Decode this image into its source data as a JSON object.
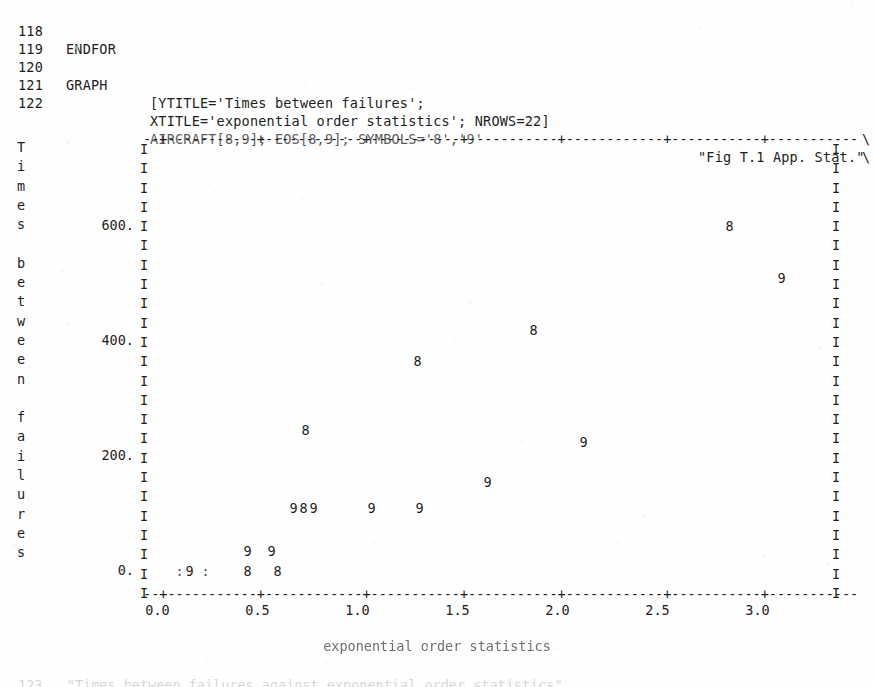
{
  "code_listing": {
    "lines": [
      {
        "num": "118",
        "keyword": "ENDFOR",
        "body": "",
        "tail": "",
        "cont": ""
      },
      {
        "num": "119",
        "keyword": "",
        "body": "",
        "tail": "",
        "cont": ""
      },
      {
        "num": "120",
        "keyword": "GRAPH",
        "body": "[YTITLE='Times between failures';",
        "tail": "",
        "cont": "\\"
      },
      {
        "num": "121",
        "keyword": "",
        "body": "XTITLE='exponential order statistics'; NROWS=22]",
        "tail": "",
        "cont": "\\"
      },
      {
        "num": "122",
        "keyword": "",
        "body": "AIRCRAFT[8,9]; EOS[8,9]; SYMBOLS='8','9'",
        "tail": "\"Fig T.1 App. Stat.\"",
        "cont": ""
      }
    ],
    "bottom_bleed": "123   \"Times between failures against exponential order statistics\""
  },
  "chart_data": {
    "type": "scatter",
    "title": "Fig T.1 App. Stat.",
    "xlabel": "exponential order statistics",
    "ylabel": "Times between failures",
    "ylabel_chars": [
      "T",
      "i",
      "m",
      "e",
      "s",
      "",
      "b",
      "e",
      "t",
      "w",
      "e",
      "e",
      "n",
      "",
      "f",
      "a",
      "i",
      "l",
      "u",
      "r",
      "e",
      "s"
    ],
    "xlim": [
      0.0,
      3.5
    ],
    "ylim": [
      0.0,
      700.0
    ],
    "xticks": [
      "0.0",
      "0.5",
      "1.0",
      "1.5",
      "2.0",
      "2.5",
      "3.0"
    ],
    "xtick_values": [
      0.0,
      0.5,
      1.0,
      1.5,
      2.0,
      2.5,
      3.0
    ],
    "yticks": [
      "600.",
      "400.",
      "200.",
      "0."
    ],
    "ytick_values": [
      600,
      400,
      200,
      0
    ],
    "nrows": 22,
    "grid": false,
    "legend": "none",
    "axis_glyphs": {
      "vertical": "I",
      "horizontal_fill": "-",
      "tick": "+",
      "overplot": ":"
    },
    "series": [
      {
        "name": "AIRCRAFT[8]",
        "symbol": "8",
        "points": [
          {
            "x": 2.86,
            "y": 610
          },
          {
            "x": 1.88,
            "y": 430
          },
          {
            "x": 1.3,
            "y": 375
          },
          {
            "x": 0.74,
            "y": 255
          },
          {
            "x": 0.73,
            "y": 120
          },
          {
            "x": 0.6,
            "y": 10
          },
          {
            "x": 0.45,
            "y": 10
          }
        ]
      },
      {
        "name": "AIRCRAFT[9]",
        "symbol": "9",
        "points": [
          {
            "x": 3.12,
            "y": 520
          },
          {
            "x": 2.13,
            "y": 235
          },
          {
            "x": 1.65,
            "y": 165
          },
          {
            "x": 1.31,
            "y": 120
          },
          {
            "x": 1.07,
            "y": 120
          },
          {
            "x": 0.78,
            "y": 120
          },
          {
            "x": 0.68,
            "y": 120
          },
          {
            "x": 0.57,
            "y": 45
          },
          {
            "x": 0.45,
            "y": 45
          },
          {
            "x": 0.16,
            "y": 10
          }
        ]
      },
      {
        "name": "overplotted",
        "symbol": ":",
        "points": [
          {
            "x": 0.11,
            "y": 10
          },
          {
            "x": 0.24,
            "y": 10
          }
        ]
      }
    ]
  },
  "colors": {
    "ink": "#1d1d1d",
    "faded_ink": "#6f6f6f",
    "paper": "#fefefe",
    "bleed": "#d8d8d8"
  }
}
